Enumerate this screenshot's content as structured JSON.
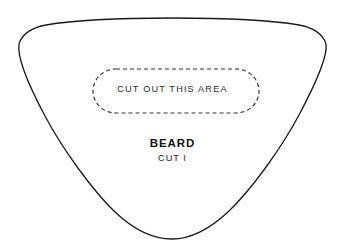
{
  "page": {
    "kind": "sewing-pattern-piece",
    "background_color": "#ffffff"
  },
  "outline": {
    "name": "beard-pattern-outline",
    "shape": "rounded-triangle",
    "stroke_color": "#1a1a1a",
    "stroke_width": 1.3,
    "fill": "none"
  },
  "cutout": {
    "name": "cut-out-region",
    "label": "CUT OUT THIS AREA",
    "shape": "rounded-rectangle",
    "stroke_color": "#333333",
    "stroke_width": 1.2,
    "dash_pattern": "4 3",
    "fill": "none"
  },
  "labels": {
    "title": "BEARD",
    "subtitle": "CUT I"
  }
}
